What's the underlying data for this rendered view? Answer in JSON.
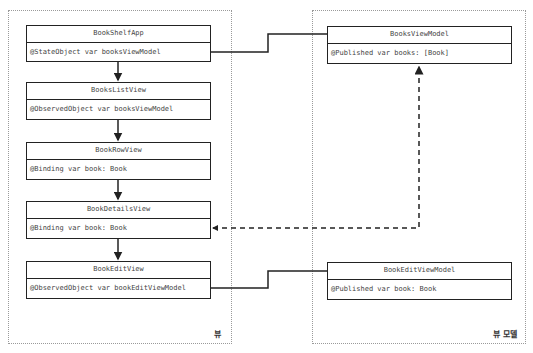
{
  "containers": {
    "views": {
      "label": "뷰"
    },
    "view_models": {
      "label": "뷰 모델"
    }
  },
  "views": [
    {
      "name": "BookShelfApp",
      "property": "@StateObject var booksViewModel"
    },
    {
      "name": "BooksListView",
      "property": "@ObservedObject var booksViewModel"
    },
    {
      "name": "BookRowView",
      "property": "@Binding var book: Book"
    },
    {
      "name": "BookDetailsView",
      "property": "@Binding var book: Book"
    },
    {
      "name": "BookEditView",
      "property": "@ObservedObject var bookEditViewModel"
    }
  ],
  "view_models": [
    {
      "name": "BooksViewModel",
      "property": "@Published var books: [Book]"
    },
    {
      "name": "BookEditViewModel",
      "property": "@Published var book: Book"
    }
  ],
  "connections": [
    {
      "from": "BookShelfApp",
      "to": "BooksListView",
      "style": "solid-arrow"
    },
    {
      "from": "BooksListView",
      "to": "BookRowView",
      "style": "solid-arrow"
    },
    {
      "from": "BookRowView",
      "to": "BookDetailsView",
      "style": "solid-arrow"
    },
    {
      "from": "BookDetailsView",
      "to": "BookEditView",
      "style": "solid-arrow"
    },
    {
      "from": "BookShelfApp",
      "to": "BooksViewModel",
      "style": "solid-line"
    },
    {
      "from": "BookEditView",
      "to": "BookEditViewModel",
      "style": "solid-line"
    },
    {
      "from": "BookDetailsView",
      "to": "BooksViewModel",
      "style": "dashed-bidirectional-arrow"
    }
  ],
  "colors": {
    "border": "#222222",
    "text": "#444444",
    "container_border": "#9a9a9a"
  }
}
